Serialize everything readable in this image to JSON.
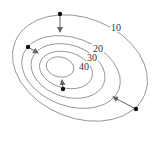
{
  "diagram": {
    "type": "contour-map",
    "contours": [
      {
        "label": "10",
        "cx": 80,
        "cy": 68,
        "rx": 70,
        "ry": 50,
        "rot": 22
      },
      {
        "label": "20",
        "cx": 71,
        "cy": 72,
        "rx": 51,
        "ry": 34,
        "rot": 20
      },
      {
        "label": "30",
        "cx": 68,
        "cy": 71,
        "rx": 38,
        "ry": 26,
        "rot": 18
      },
      {
        "label": "40",
        "cx": 66,
        "cy": 70,
        "rx": 27,
        "ry": 18,
        "rot": 15
      },
      {
        "label": "",
        "cx": 60,
        "cy": 67,
        "rx": 14,
        "ry": 10,
        "rot": 12
      }
    ],
    "labels": [
      {
        "text": "10",
        "x": 111,
        "y": 31
      },
      {
        "text": "20",
        "x": 93,
        "y": 52
      },
      {
        "text": "30",
        "x": 87,
        "y": 61
      },
      {
        "text": "40",
        "x": 79,
        "y": 70
      }
    ],
    "points": [
      {
        "x": 60,
        "y": 14,
        "ax": 60,
        "ay": 32
      },
      {
        "x": 28,
        "y": 47,
        "ax": 38,
        "ay": 53
      },
      {
        "x": 63,
        "y": 89,
        "ax": 62,
        "ay": 80
      },
      {
        "x": 136,
        "y": 109,
        "ax": 113,
        "ay": 97
      }
    ],
    "colors": {
      "line": "#888888",
      "point": "#111111",
      "arrow": "#666666"
    }
  }
}
